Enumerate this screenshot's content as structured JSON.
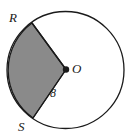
{
  "figure": {
    "shape": "circle",
    "background_color": "#ffffff",
    "stroke_color": "#1a1a1a",
    "shaded_fill_color": "#8a8a8a",
    "unshaded_fill_color": "#ffffff",
    "circle": {
      "center_x": 65.5,
      "center_y": 70,
      "radius_px": 58.5,
      "stroke_width": 1.3
    },
    "center_point": {
      "name": "center-dot",
      "x": 66,
      "y": 69.5,
      "radius_px": 3.2,
      "fill": "#1a1a1a"
    },
    "points": [
      {
        "id": "R",
        "label": "R",
        "x": 32.0,
        "y": 23.0,
        "angle_deg": 143
      },
      {
        "id": "O",
        "label": "O",
        "x": 66.0,
        "y": 69.5,
        "angle_deg": null
      },
      {
        "id": "S",
        "label": "S",
        "x": 33.0,
        "y": 118.0,
        "angle_deg": 215
      }
    ],
    "radii": [
      {
        "from": "O",
        "to": "R"
      },
      {
        "from": "O",
        "to": "S"
      }
    ],
    "measures": [
      {
        "id": "radius-length",
        "value": "8",
        "applies_to": "OS",
        "units": ""
      }
    ],
    "sector": {
      "vertices": [
        "R",
        "O",
        "S"
      ],
      "arc_from": "R",
      "arc_to": "S",
      "arc_side": "left",
      "sweep_deg": 144,
      "shaded": true
    },
    "labels": {
      "R": "R",
      "O": "O",
      "S": "S",
      "radius": "8"
    }
  }
}
